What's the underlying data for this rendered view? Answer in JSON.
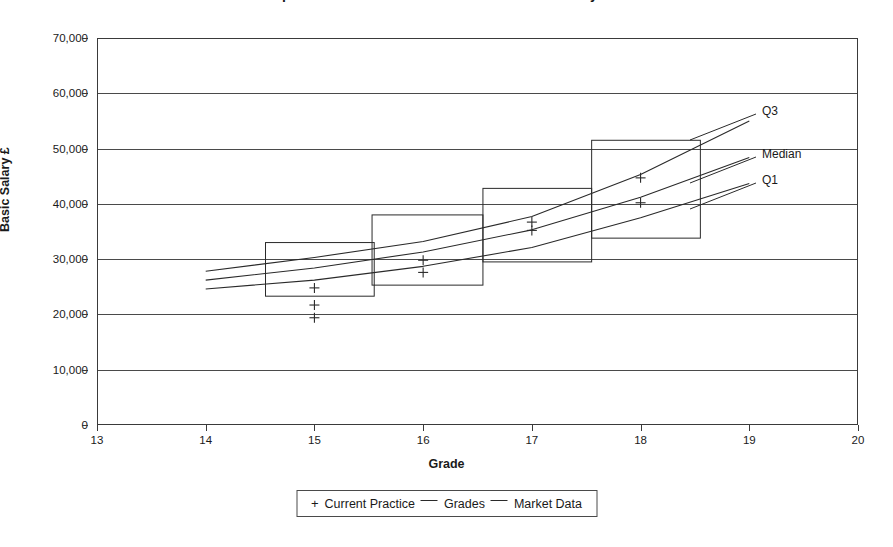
{
  "chart_title": "Comparison of Current Practice with Market Data by Grade",
  "axis": {
    "y_title": "Basic Salary £",
    "x_title": "Grade",
    "y_ticks": [
      "0",
      "10,000",
      "20,000",
      "30,000",
      "40,000",
      "50,000",
      "60,000",
      "70,000"
    ],
    "x_ticks": [
      "13",
      "14",
      "15",
      "16",
      "17",
      "18",
      "19",
      "20"
    ]
  },
  "series_labels": {
    "q3": "Q3",
    "median": "Median",
    "q1": "Q1"
  },
  "legend": {
    "marker_symbol": "+",
    "items": [
      "Current Practice",
      "Grades",
      "Market Data"
    ]
  },
  "colors": {
    "line": "#2a2a2a",
    "grid": "#4a4a4a",
    "frame": "#3a3a3a",
    "text": "#1a1a1a",
    "background": "#ffffff"
  },
  "chart_data": {
    "type": "scatter",
    "title": "Comparison of Current Practice with Market Data by Grade",
    "xlabel": "Grade",
    "ylabel": "Basic Salary £",
    "xlim": [
      13,
      20
    ],
    "ylim": [
      0,
      70000
    ],
    "ytick_step": 10000,
    "grid": true,
    "legend_position": "bottom",
    "series": [
      {
        "name": "Market Data",
        "type": "line",
        "label": "Q3",
        "x": [
          14,
          15,
          16,
          17,
          18,
          19
        ],
        "values": [
          27800,
          30300,
          33200,
          37700,
          45300,
          55000
        ]
      },
      {
        "name": "Market Data",
        "type": "line",
        "label": "Median",
        "x": [
          14,
          15,
          16,
          17,
          18,
          19
        ],
        "values": [
          26200,
          28400,
          31300,
          35300,
          41200,
          48400
        ]
      },
      {
        "name": "Market Data",
        "type": "line",
        "label": "Q1",
        "x": [
          14,
          15,
          16,
          17,
          18,
          19
        ],
        "values": [
          24600,
          26200,
          28700,
          32100,
          37500,
          43700
        ]
      },
      {
        "name": "Current Practice",
        "type": "scatter",
        "marker": "+",
        "points": [
          {
            "x": 15,
            "y": 24800
          },
          {
            "x": 15,
            "y": 21700
          },
          {
            "x": 15,
            "y": 19400
          },
          {
            "x": 16,
            "y": 29800
          },
          {
            "x": 16,
            "y": 27600
          },
          {
            "x": 17,
            "y": 36700
          },
          {
            "x": 17,
            "y": 35200
          },
          {
            "x": 18,
            "y": 44700
          },
          {
            "x": 18,
            "y": 40200
          }
        ]
      },
      {
        "name": "Grades",
        "type": "box",
        "boxes": [
          {
            "grade": 15,
            "x_from": 14.55,
            "x_to": 15.55,
            "y_top": 33000,
            "y_bottom": 23300
          },
          {
            "grade": 16,
            "x_from": 15.53,
            "x_to": 16.55,
            "y_top": 38000,
            "y_bottom": 25300
          },
          {
            "grade": 17,
            "x_from": 16.55,
            "x_to": 17.55,
            "y_top": 42800,
            "y_bottom": 29500
          },
          {
            "grade": 18,
            "x_from": 17.55,
            "x_to": 18.55,
            "y_top": 51500,
            "y_bottom": 33800
          }
        ]
      }
    ]
  }
}
